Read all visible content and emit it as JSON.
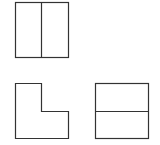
{
  "diagram": {
    "type": "orthographic-three-view",
    "stroke_color": "#333333",
    "background": "#ffffff",
    "views": {
      "top": {
        "label": "",
        "outline": {
          "x": 15,
          "y": 2,
          "w": 53,
          "h": 55
        },
        "divider": {
          "orientation": "vertical",
          "x": 41
        }
      },
      "front": {
        "label": "",
        "shape": "L",
        "points": "15,83 41,83 41,111 68,111 68,138 15,138"
      },
      "side": {
        "label": "",
        "outline": {
          "x": 95,
          "y": 83,
          "w": 53,
          "h": 55
        },
        "divider": {
          "orientation": "horizontal",
          "y": 111
        }
      }
    }
  }
}
